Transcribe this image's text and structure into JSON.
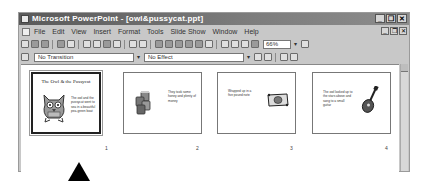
{
  "window": {
    "title": "Microsoft PowerPoint - [owl&pussycat.ppt]",
    "controls": [
      "minimize",
      "restore",
      "close"
    ]
  },
  "menubar": {
    "items": [
      {
        "label": "File"
      },
      {
        "label": "Edit"
      },
      {
        "label": "View"
      },
      {
        "label": "Insert"
      },
      {
        "label": "Format"
      },
      {
        "label": "Tools"
      },
      {
        "label": "Slide Show"
      },
      {
        "label": "Window"
      },
      {
        "label": "Help"
      }
    ]
  },
  "toolbar": {
    "zoom_value": "66%"
  },
  "slide_sorter_toolbar": {
    "transition_value": "No Transition",
    "effect_value": "No Effect"
  },
  "slides": [
    {
      "number": "1",
      "title": "The Owl & the Pussycat",
      "text": "The owl and the pussycat went to sea in a beautiful pea-green boat",
      "art": "owl-cartoon",
      "selected": true
    },
    {
      "number": "2",
      "title": "",
      "text": "They took some honey and plenty of money",
      "art": "honey-jars",
      "selected": false
    },
    {
      "number": "3",
      "title": "",
      "text": "Wrapped up in a five pound note",
      "art": "banknote",
      "selected": false
    },
    {
      "number": "4",
      "title": "",
      "text": "The owl looked up to the stars above and sang to a small guitar",
      "art": "guitar",
      "selected": false
    }
  ],
  "annotation": {
    "pointer": "arrow-pointing-to-slide-1"
  }
}
